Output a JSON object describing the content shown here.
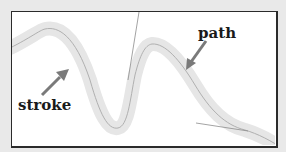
{
  "diagram": {
    "labels": {
      "path": "path",
      "stroke": "stroke"
    },
    "colors": {
      "background": "#e9e9e9",
      "frame_fill": "#ffffff",
      "frame_border": "#2b2b2b",
      "stroke_band": "#e4e4e4",
      "path_line": "#9a9a9a",
      "handle_line": "#8c8c8c",
      "arrow": "#7a7a7a",
      "label_text": "#1a1a1a"
    },
    "icons": {
      "path_arrow": "arrow-down-left",
      "stroke_arrow": "arrow-up-right"
    }
  }
}
